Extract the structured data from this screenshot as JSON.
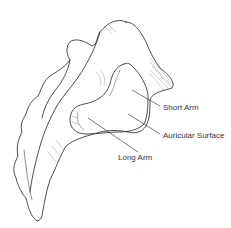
{
  "figure": {
    "line_color": "#222222",
    "background": "#ffffff"
  },
  "labels": {
    "short_arm": "Short Arm",
    "auricular_surface": "Auricular Surface",
    "long_arm": "Long Arm"
  }
}
